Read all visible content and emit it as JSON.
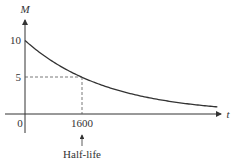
{
  "chart_data": {
    "type": "line",
    "title": "",
    "xlabel": "t",
    "ylabel": "M",
    "series": [
      {
        "name": "M(t) = 10·(1/2)^(t/1600)",
        "x": [
          0,
          800,
          1600,
          2400,
          3200,
          4000,
          4800,
          5600
        ],
        "values": [
          10,
          7.07,
          5,
          3.54,
          2.5,
          1.77,
          1.25,
          0.88
        ]
      }
    ],
    "y_ticks": [
      "10",
      "5"
    ],
    "x_ticks": [
      "1600"
    ],
    "origin_label": "0",
    "annotations": [
      {
        "text": "Half-life",
        "points_to": "1600",
        "type": "arrow"
      },
      {
        "type": "dashed-guide",
        "from": [
          0,
          5
        ],
        "to": [
          1600,
          5
        ]
      },
      {
        "type": "dashed-guide",
        "from": [
          1600,
          0
        ],
        "to": [
          1600,
          5
        ]
      }
    ],
    "grid": false,
    "legend": "none"
  },
  "labels": {
    "y_axis": "M",
    "x_axis": "t",
    "tick_10": "10",
    "tick_5": "5",
    "origin": "0",
    "tick_1600": "1600",
    "annotation": "Half-life"
  },
  "colors": {
    "axis": "#333333",
    "curve": "#333333",
    "dashed": "#555555"
  }
}
